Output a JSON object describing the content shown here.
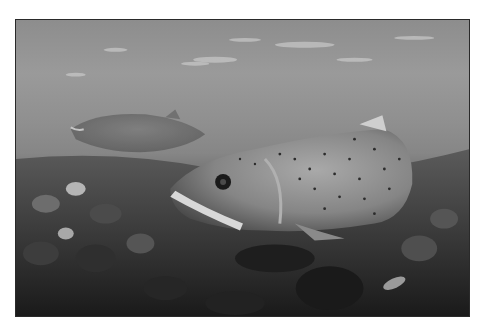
{
  "image": {
    "description": "Grayscale underwater photograph of two spotted trout over a rocky riverbed, surface ripples above",
    "alt": "Underwater photo of spotted trout over river stones",
    "subjects": [
      "foreground-trout",
      "background-trout",
      "riverbed-stones",
      "water-surface"
    ],
    "colors": {
      "border": "#2a2a2a",
      "background": "#ffffff",
      "water": "#8f8f8f",
      "riverbed": "#2f2f2f",
      "fish_body": "#7c7c7c"
    }
  }
}
